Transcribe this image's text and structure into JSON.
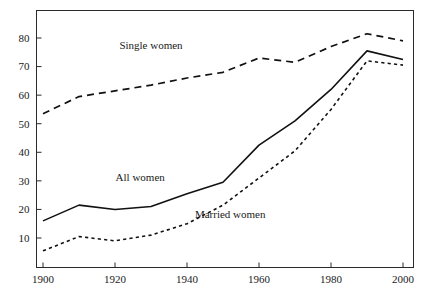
{
  "chart_data": {
    "type": "line",
    "title": "",
    "subtitle": "",
    "xlabel": "",
    "ylabel": "",
    "xlim": [
      1900,
      2003
    ],
    "ylim": [
      0,
      88
    ],
    "xticks": [
      1900,
      1920,
      1940,
      1960,
      1980,
      2000
    ],
    "xticklabels": [
      "1900",
      "1920",
      "1940",
      "1960",
      "1980",
      "2000"
    ],
    "yticks": [
      10,
      20,
      30,
      40,
      50,
      60,
      70,
      80
    ],
    "yticklabels": [
      "10",
      "20",
      "30",
      "40",
      "50",
      "60",
      "70",
      "80"
    ],
    "grid": false,
    "legend_position": "inline-annotations",
    "x": [
      1900,
      1910,
      1920,
      1930,
      1940,
      1950,
      1960,
      1970,
      1980,
      1990,
      2000
    ],
    "series": [
      {
        "name": "Single women",
        "style": "long-dashed",
        "color": "#111111",
        "label_text": "Single women",
        "label_x": 1930,
        "label_y": 76,
        "values": [
          53.5,
          59.5,
          61.5,
          63.5,
          66.0,
          68.0,
          73.0,
          71.5,
          77.0,
          81.5,
          79.0
        ]
      },
      {
        "name": "All women",
        "style": "solid",
        "color": "#111111",
        "label_text": "All women",
        "label_x": 1927,
        "label_y": 30,
        "values": [
          16.0,
          21.5,
          20.0,
          21.0,
          25.5,
          29.5,
          42.5,
          51.0,
          62.0,
          75.5,
          72.5
        ]
      },
      {
        "name": "Married women",
        "style": "short-dashed",
        "color": "#111111",
        "label_text": "Married women",
        "label_x": 1952,
        "label_y": 17,
        "values": [
          5.5,
          10.5,
          9.0,
          11.0,
          15.0,
          21.5,
          31.0,
          40.5,
          55.0,
          72.0,
          70.5
        ]
      }
    ]
  },
  "caption": {
    "clipped_text": ""
  }
}
